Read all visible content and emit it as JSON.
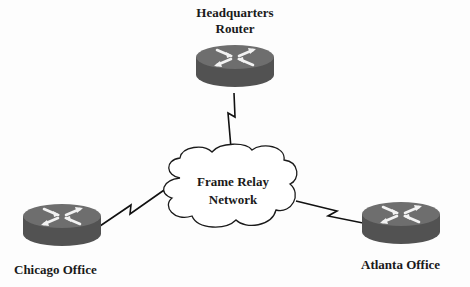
{
  "diagram": {
    "type": "network-topology",
    "background_color": "#fdfdfd",
    "router_top_color": "#6e6e6e",
    "router_side_color": "#525252",
    "router_arrow_color": "#f2f2f2",
    "link_color": "#111111",
    "cloud": {
      "label_line1": "Frame Relay",
      "label_line2": "Network",
      "icon": "cloud-icon"
    },
    "nodes": [
      {
        "id": "headquarters",
        "label_line1": "Headquarters",
        "label_line2": "Router",
        "icon": "router-icon"
      },
      {
        "id": "chicago",
        "label": "Chicago Office",
        "icon": "router-icon"
      },
      {
        "id": "atlanta",
        "label": "Atlanta Office",
        "icon": "router-icon"
      }
    ],
    "links": [
      {
        "from": "headquarters",
        "to": "cloud",
        "style": "serial-lightning"
      },
      {
        "from": "chicago",
        "to": "cloud",
        "style": "serial-lightning"
      },
      {
        "from": "atlanta",
        "to": "cloud",
        "style": "serial-lightning"
      }
    ]
  }
}
